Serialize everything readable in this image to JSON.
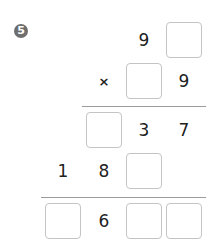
{
  "problem": {
    "number": "5",
    "number_glyph": "❺",
    "operator": "×",
    "rows": {
      "multiplicand": [
        "9",
        ""
      ],
      "multiplier": [
        "",
        "9"
      ],
      "partial1": [
        "",
        "3",
        "7"
      ],
      "partial2": [
        "1",
        "8",
        ""
      ],
      "result": [
        "",
        "6",
        "",
        ""
      ]
    }
  },
  "colors": {
    "box_border": "#c4c4c4",
    "line": "#9a9a9a",
    "text": "#222222",
    "badge": "#6e6e6e"
  }
}
